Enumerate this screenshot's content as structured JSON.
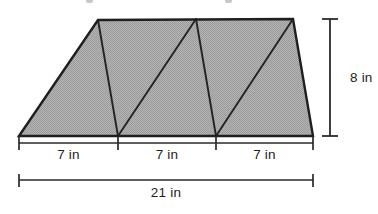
{
  "figure": {
    "kind": "geometry-diagram",
    "fill_color": "#a9a9a9",
    "outline_color": "#1f1f1f",
    "dimension_color": "#1d1d1d",
    "background_color": "#ffffff"
  },
  "shape": {
    "name": "trapezoid",
    "vertices": {
      "bottom_left": [
        19,
        136
      ],
      "top_left": [
        98,
        20
      ],
      "top_right": [
        293,
        19
      ],
      "bottom_right": [
        313,
        136
      ]
    },
    "interior_lines": [
      {
        "from": [
          98,
          20
        ],
        "to": [
          118,
          136
        ]
      },
      {
        "from": [
          118,
          136
        ],
        "to": [
          196,
          19
        ]
      },
      {
        "from": [
          196,
          19
        ],
        "to": [
          216,
          136
        ]
      },
      {
        "from": [
          216,
          136
        ],
        "to": [
          293,
          19
        ]
      }
    ],
    "triangle_count": 4
  },
  "dimensions": {
    "height": {
      "label": "8 in",
      "value": 8,
      "unit": "in",
      "orientation": "vertical",
      "label_x": 350,
      "label_y": 71,
      "line_x": 330,
      "line_top": 19,
      "line_bottom": 136
    },
    "segments": {
      "line_y": 143,
      "tick_positions": [
        19,
        118,
        216,
        313
      ],
      "items": [
        {
          "label": "7 in",
          "value": 7,
          "unit": "in",
          "center_x": 68.5,
          "label_y": 148
        },
        {
          "label": "7 in",
          "value": 7,
          "unit": "in",
          "center_x": 167,
          "label_y": 148
        },
        {
          "label": "7 in",
          "value": 7,
          "unit": "in",
          "center_x": 264.5,
          "label_y": 148
        }
      ]
    },
    "total_base": {
      "label": "21 in",
      "value": 21,
      "unit": "in",
      "line_y": 180,
      "line_left": 19,
      "line_right": 313,
      "center_x": 166,
      "label_y": 186
    }
  }
}
